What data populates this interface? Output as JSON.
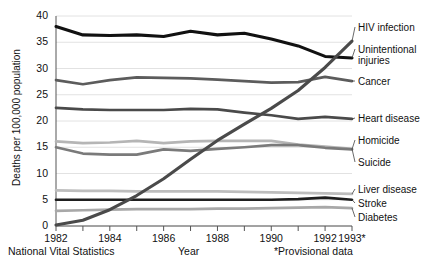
{
  "chart_data": {
    "type": "line",
    "title": "",
    "xlabel": "Year",
    "ylabel": "Deaths per 100,000 population",
    "source": "National Vital Statistics",
    "footnote": "*Provisional data",
    "x": [
      1982,
      1983,
      1984,
      1985,
      1986,
      1987,
      1988,
      1989,
      1990,
      1991,
      1992,
      1993
    ],
    "xticklabels": [
      "1982",
      "",
      "1984",
      "",
      "1986",
      "",
      "1988",
      "",
      "1990",
      "",
      "1992",
      "1993*"
    ],
    "xlim": [
      1982,
      1993
    ],
    "ylim": [
      0,
      40
    ],
    "yticks": [
      0,
      5,
      10,
      15,
      20,
      25,
      30,
      35,
      40
    ],
    "yticklabels": [
      "0",
      "5",
      "10",
      "15",
      "20",
      "25",
      "30",
      "35",
      "40"
    ],
    "grid": "horizontal",
    "legend_position": "right-inline-labels",
    "series": [
      {
        "name": "Unintentional injuries",
        "color": "#111111",
        "width": 3.1,
        "values": [
          38.0,
          36.4,
          36.3,
          36.4,
          36.1,
          37.1,
          36.4,
          36.7,
          35.6,
          34.3,
          32.3,
          32.0
        ]
      },
      {
        "name": "Cancer",
        "color": "#5c5c5c",
        "width": 2.7,
        "values": [
          27.8,
          27.0,
          27.8,
          28.3,
          28.2,
          28.1,
          27.9,
          27.6,
          27.3,
          27.4,
          28.4,
          27.6
        ]
      },
      {
        "name": "Heart disease",
        "color": "#4a4a4a",
        "width": 2.7,
        "values": [
          22.5,
          22.2,
          22.1,
          22.1,
          22.1,
          22.3,
          22.2,
          21.6,
          21.1,
          20.4,
          20.8,
          20.4
        ]
      },
      {
        "name": "Suicide",
        "color": "#b5b5b5",
        "width": 2.7,
        "values": [
          16.1,
          15.8,
          15.9,
          16.2,
          15.8,
          16.1,
          16.2,
          16.2,
          16.2,
          15.5,
          15.1,
          14.7
        ]
      },
      {
        "name": "Homicide",
        "color": "#7a7a7a",
        "width": 2.7,
        "values": [
          15.0,
          13.8,
          13.6,
          13.6,
          14.6,
          14.3,
          14.7,
          15.0,
          15.4,
          15.4,
          14.9,
          14.6
        ]
      },
      {
        "name": "Liver disease",
        "color": "#bdbdbd",
        "width": 2.7,
        "values": [
          6.8,
          6.7,
          6.7,
          6.6,
          6.6,
          6.6,
          6.6,
          6.5,
          6.4,
          6.3,
          6.2,
          6.1
        ]
      },
      {
        "name": "Stroke",
        "color": "#1f1f1f",
        "width": 2.7,
        "values": [
          5.0,
          5.0,
          5.0,
          5.0,
          5.0,
          5.0,
          5.0,
          5.0,
          5.0,
          5.1,
          5.4,
          5.0
        ]
      },
      {
        "name": "Diabetes",
        "color": "#a8a8a8",
        "width": 2.7,
        "values": [
          2.9,
          3.0,
          3.1,
          3.2,
          3.2,
          3.2,
          3.3,
          3.3,
          3.4,
          3.5,
          3.6,
          3.4
        ]
      },
      {
        "name": "HIV infection",
        "color": "#4a4a4a",
        "width": 3.1,
        "values": [
          0.2,
          1.1,
          3.1,
          5.8,
          9.0,
          12.7,
          16.3,
          19.4,
          22.4,
          25.8,
          30.2,
          35.2
        ]
      }
    ]
  },
  "axis": {
    "y_title": "Deaths per 100,000 population",
    "x_title": "Year"
  },
  "labels": {
    "hiv": "HIV infection",
    "unintentional_1": "Unintentional",
    "unintentional_2": "injuries",
    "cancer": "Cancer",
    "heart": "Heart disease",
    "homicide": "Homicide",
    "suicide": "Suicide",
    "liver": "Liver disease",
    "stroke": "Stroke",
    "diabetes": "Diabetes"
  },
  "footer": {
    "source": "National Vital Statistics",
    "xlabel": "Year",
    "note": "*Provisional data"
  },
  "colors": {
    "background": "#ffffff",
    "text": "#111111",
    "grid": "#e2e2e2",
    "axis": "#555555"
  }
}
